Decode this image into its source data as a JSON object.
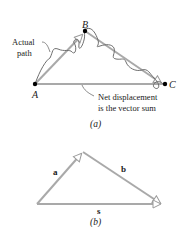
{
  "figure_a": {
    "points": {
      "A": {
        "label": "A",
        "x": 35,
        "y": 84
      },
      "B": {
        "label": "B",
        "x": 85,
        "y": 31
      },
      "C": {
        "label": "C",
        "x": 164,
        "y": 84
      }
    },
    "annotations": {
      "actual_path_line1": "Actual",
      "actual_path_line2": "path",
      "net_line1": "Net displacement",
      "net_line2": "is the vector sum"
    },
    "caption": "(a)"
  },
  "figure_b": {
    "vectors": {
      "a": {
        "label": "a"
      },
      "b": {
        "label": "b"
      },
      "s": {
        "label": "s"
      }
    },
    "caption": "(b)"
  },
  "colors": {
    "vector": "#a9a9a9",
    "path": "#6f6f6f",
    "text": "#1a1a1a",
    "point": "#000000"
  }
}
